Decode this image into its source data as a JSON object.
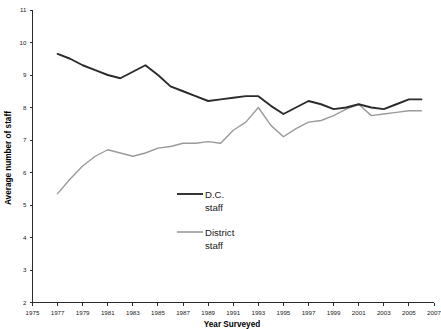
{
  "chart_data": {
    "type": "line",
    "title": "",
    "xlabel": "Year Surveyed",
    "ylabel": "Average number of staff",
    "xlim": [
      1975,
      2007
    ],
    "ylim": [
      2,
      11
    ],
    "grid": false,
    "legend_position": "inside-center",
    "x_ticks": [
      1975,
      1977,
      1979,
      1981,
      1983,
      1985,
      1987,
      1989,
      1991,
      1993,
      1995,
      1997,
      1999,
      2001,
      2003,
      2005,
      2007
    ],
    "y_ticks": [
      2,
      3,
      4,
      5,
      6,
      7,
      8,
      9,
      10,
      11
    ],
    "x": [
      1977,
      1978,
      1979,
      1980,
      1981,
      1982,
      1983,
      1984,
      1985,
      1986,
      1987,
      1988,
      1989,
      1990,
      1991,
      1992,
      1993,
      1994,
      1995,
      1996,
      1997,
      1998,
      1999,
      2000,
      2001,
      2002,
      2003,
      2004,
      2005,
      2006
    ],
    "series": [
      {
        "name": "D.C. staff",
        "color": "#2b2b2b",
        "values": [
          9.65,
          9.5,
          9.3,
          9.15,
          9.0,
          8.9,
          9.1,
          9.3,
          9.0,
          8.65,
          8.5,
          8.35,
          8.2,
          8.25,
          8.3,
          8.35,
          8.35,
          8.05,
          7.8,
          8.0,
          8.2,
          8.1,
          7.95,
          8.0,
          8.1,
          8.0,
          7.95,
          8.1,
          8.25,
          8.25
        ]
      },
      {
        "name": "District staff",
        "color": "#9a9a9a",
        "values": [
          5.35,
          5.8,
          6.2,
          6.5,
          6.7,
          6.6,
          6.5,
          6.6,
          6.75,
          6.8,
          6.9,
          6.9,
          6.95,
          6.9,
          7.3,
          7.55,
          8.0,
          7.45,
          7.1,
          7.35,
          7.55,
          7.6,
          7.75,
          7.95,
          8.1,
          7.75,
          7.8,
          7.85,
          7.9,
          7.9
        ]
      }
    ]
  },
  "legend": {
    "entries": [
      {
        "label_line1": "D.C.",
        "label_line2": "staff",
        "color": "#2b2b2b"
      },
      {
        "label_line1": "District",
        "label_line2": "staff",
        "color": "#9a9a9a"
      }
    ]
  },
  "axes": {
    "y_axis_title": "Average number of staff",
    "x_axis_title": "Year Surveyed"
  }
}
